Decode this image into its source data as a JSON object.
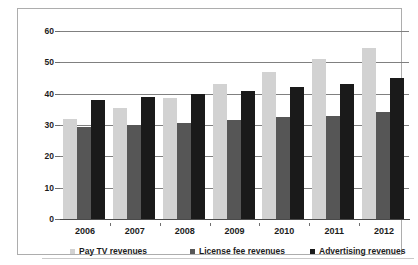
{
  "chart_data": {
    "type": "bar",
    "title": "",
    "subtitle": "",
    "xlabel": "",
    "ylabel": "",
    "categories": [
      "2006",
      "2007",
      "2008",
      "2009",
      "2010",
      "2011",
      "2012"
    ],
    "series": [
      {
        "name": "Pay TV revenues",
        "color": "#d2d2d2",
        "values": [
          32,
          35.5,
          38.5,
          43,
          47,
          51,
          54.5
        ]
      },
      {
        "name": "License fee revenues",
        "color": "#565656",
        "values": [
          29.5,
          30,
          30.5,
          31.5,
          32.5,
          33,
          34
        ]
      },
      {
        "name": "Advertising revenues",
        "color": "#1a1a1a",
        "values": [
          38,
          39,
          40,
          41,
          42,
          43,
          45
        ]
      }
    ],
    "ylim": [
      0,
      60
    ],
    "yticks": [
      0,
      10,
      20,
      30,
      40,
      50,
      60
    ],
    "ytick_labels": [
      "0",
      "10",
      "20",
      "30",
      "40",
      "50",
      "60"
    ],
    "grid": true,
    "grid_axis": "y",
    "legend_position": "bottom",
    "background": "#ffffff",
    "frame_color": "#adadad"
  }
}
